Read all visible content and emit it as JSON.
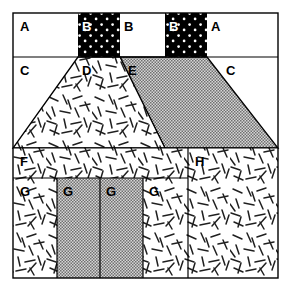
{
  "figure": {
    "width": 290,
    "height": 292,
    "frame": {
      "x": 13,
      "y": 13,
      "width": 265,
      "height": 265
    },
    "background_color": "#ffffff",
    "stroke_color": "#000000"
  },
  "fills": {
    "white": "#ffffff",
    "black_dotted": "#000000",
    "dot_color": "#ffffff",
    "gray_stipple": "#a8a8a8",
    "gray_stipple_light": "#c9c9c9",
    "speckle_bg": "#ffffff",
    "speckle_mark": "#1a1a1a"
  },
  "rows": [
    {
      "name": "row-top",
      "y_top": 13,
      "y_bottom": 57
    },
    {
      "name": "row-trapezoid",
      "y_top": 57,
      "y_bottom": 148
    },
    {
      "name": "row-middle",
      "y_top": 148,
      "y_bottom": 178
    },
    {
      "name": "row-bottom",
      "y_top": 178,
      "y_bottom": 278
    }
  ],
  "regions": [
    {
      "id": "region-a-left",
      "label": "A",
      "fill": "white",
      "label_x": 20,
      "label_y": 31,
      "shape": "rect",
      "x": 13,
      "y": 13,
      "width": 65,
      "height": 44
    },
    {
      "id": "region-b-left-dotted",
      "label": "B",
      "fill": "black_dotted",
      "label_x": 82,
      "label_y": 31,
      "label_color": "white",
      "shape": "rect",
      "x": 78,
      "y": 13,
      "width": 42,
      "height": 44
    },
    {
      "id": "region-b-center",
      "label": "B",
      "fill": "white",
      "label_x": 124,
      "label_y": 31,
      "shape": "rect",
      "x": 120,
      "y": 13,
      "width": 45,
      "height": 44
    },
    {
      "id": "region-b-right-dotted",
      "label": "B",
      "fill": "black_dotted",
      "label_x": 169,
      "label_y": 31,
      "label_color": "white",
      "shape": "rect",
      "x": 165,
      "y": 13,
      "width": 42,
      "height": 44
    },
    {
      "id": "region-a-right",
      "label": "A",
      "fill": "white",
      "label_x": 211,
      "label_y": 31,
      "shape": "rect",
      "x": 207,
      "y": 13,
      "width": 71,
      "height": 44
    },
    {
      "id": "region-c-left",
      "label": "C",
      "fill": "white",
      "label_x": 20,
      "label_y": 75,
      "shape": "background"
    },
    {
      "id": "region-d-trapezoid",
      "label": "D",
      "fill": "speckle",
      "label_x": 82,
      "label_y": 75,
      "shape": "polygon",
      "points": "78,57 120,57 165,148 13,148"
    },
    {
      "id": "region-e-trapezoid",
      "label": "E",
      "fill": "gray_stipple",
      "label_x": 128,
      "label_y": 75,
      "shape": "polygon",
      "points": "120,57 207,57 278,148 165,148"
    },
    {
      "id": "region-c-right",
      "label": "C",
      "fill": "white",
      "label_x": 226,
      "label_y": 75,
      "shape": "background"
    },
    {
      "id": "region-f",
      "label": "F",
      "fill": "speckle",
      "label_x": 20,
      "label_y": 166,
      "shape": "rect",
      "x": 13,
      "y": 148,
      "width": 175,
      "height": 30
    },
    {
      "id": "region-h",
      "label": "H",
      "fill": "speckle",
      "label_x": 195,
      "label_y": 166,
      "shape": "rect",
      "x": 188,
      "y": 148,
      "width": 90,
      "height": 130
    },
    {
      "id": "region-g-1",
      "label": "G",
      "fill": "speckle",
      "label_x": 20,
      "label_y": 196,
      "shape": "rect",
      "x": 13,
      "y": 178,
      "width": 44,
      "height": 100
    },
    {
      "id": "region-g-2",
      "label": "G",
      "fill": "gray_stipple",
      "label_x": 63,
      "label_y": 196,
      "shape": "rect",
      "x": 57,
      "y": 178,
      "width": 43,
      "height": 100
    },
    {
      "id": "region-g-3",
      "label": "G",
      "fill": "gray_stipple",
      "label_x": 106,
      "label_y": 196,
      "shape": "rect",
      "x": 100,
      "y": 178,
      "width": 43,
      "height": 100
    },
    {
      "id": "region-g-4",
      "label": "G",
      "fill": "speckle",
      "label_x": 149,
      "label_y": 196,
      "shape": "rect",
      "x": 143,
      "y": 178,
      "width": 45,
      "height": 100
    }
  ],
  "legend_letters": [
    "A",
    "B",
    "C",
    "D",
    "E",
    "F",
    "G",
    "H"
  ]
}
